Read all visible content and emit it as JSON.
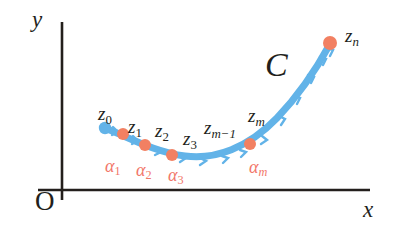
{
  "figure": {
    "caption_type": "complex-contour-partition",
    "background_color": "#ffffff"
  },
  "axes": {
    "x_axis_label": "x",
    "y_axis_label": "y",
    "origin_label": "O",
    "axis_color": "#231f1c",
    "x_axis": {
      "x_start": 38,
      "x_end": 370,
      "y": 190
    },
    "y_axis": {
      "y_start": 22,
      "y_end": 200,
      "x": 62
    }
  },
  "curve": {
    "name_label": "C",
    "stroke_color": "#62b3e8",
    "stroke_width": 7,
    "direction": "left-to-right",
    "tick_marks_count": 13,
    "path": "M 105 128 C 130 138, 155 152, 185 156 C 215 160, 248 148, 277 118 C 300 94, 318 66, 330 44"
  },
  "points": {
    "start_dot_color": "#62b3e8",
    "node_dot_color": "#f28062",
    "nodes": [
      {
        "label_id": "z0",
        "x": 105,
        "y": 128,
        "color": "#62b3e8",
        "r": 6
      },
      {
        "label_id": "z1",
        "x": 123,
        "y": 134,
        "color": "#f28062",
        "r": 6
      },
      {
        "label_id": "z2",
        "x": 145,
        "y": 145,
        "color": "#f28062",
        "r": 6
      },
      {
        "label_id": "z3",
        "x": 172,
        "y": 155,
        "color": "#f28062",
        "r": 6
      },
      {
        "label_id": "zm",
        "x": 250,
        "y": 144,
        "color": "#f28062",
        "r": 6
      },
      {
        "label_id": "zn",
        "x": 330,
        "y": 43,
        "color": "#f28062",
        "r": 7
      }
    ]
  },
  "z_labels": [
    {
      "id": "z0",
      "base": "z",
      "subscript": "0",
      "x": 98,
      "y": 104,
      "subscript_style": "plain"
    },
    {
      "id": "z1",
      "base": "z",
      "subscript": "1",
      "x": 128,
      "y": 117,
      "subscript_style": "plain"
    },
    {
      "id": "z2",
      "base": "z",
      "subscript": "2",
      "x": 155,
      "y": 121,
      "subscript_style": "plain"
    },
    {
      "id": "z3",
      "base": "z",
      "subscript": "3",
      "x": 183,
      "y": 129,
      "subscript_style": "plain"
    },
    {
      "id": "zm1",
      "base": "z",
      "subscript": "m−1",
      "x": 204,
      "y": 118,
      "subscript_style": "italic"
    },
    {
      "id": "zm",
      "base": "z",
      "subscript": "m",
      "x": 248,
      "y": 106,
      "subscript_style": "italic"
    },
    {
      "id": "zn",
      "base": "z",
      "subscript": "n",
      "x": 345,
      "y": 26,
      "subscript_style": "italic"
    }
  ],
  "alpha_labels": [
    {
      "id": "a1",
      "base": "α",
      "subscript": "1",
      "x": 105,
      "y": 157,
      "subscript_style": "plain"
    },
    {
      "id": "a2",
      "base": "α",
      "subscript": "2",
      "x": 136,
      "y": 161,
      "subscript_style": "plain"
    },
    {
      "id": "a3",
      "base": "α",
      "subscript": "3",
      "x": 168,
      "y": 166,
      "subscript_style": "plain"
    },
    {
      "id": "am",
      "base": "α",
      "subscript": "m",
      "x": 249,
      "y": 158,
      "subscript_style": "italic"
    }
  ],
  "curve_label": {
    "text": "C",
    "x": 265,
    "y": 48
  },
  "colors": {
    "curve_blue": "#62b3e8",
    "node_orange": "#f28062",
    "alpha_red": "#f2776a",
    "ink_black": "#231f1c"
  }
}
